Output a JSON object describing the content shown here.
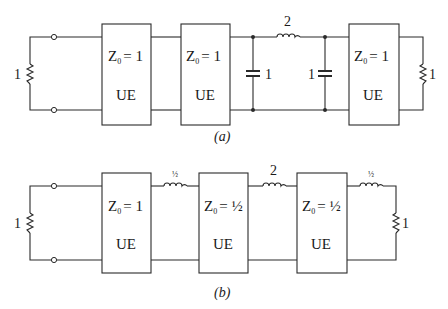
{
  "figure": {
    "background": "#ffffff",
    "line_color": "#2a2a2a"
  },
  "diagram_a": {
    "caption": "(a)",
    "source_resistor": {
      "value": "1"
    },
    "unit_elements": [
      {
        "z_label": "Z",
        "z_sub": "0",
        "z_eq": "= 1",
        "type": "UE"
      },
      {
        "z_label": "Z",
        "z_sub": "0",
        "z_eq": "= 1",
        "type": "UE"
      },
      {
        "z_label": "Z",
        "z_sub": "0",
        "z_eq": "= 1",
        "type": "UE"
      }
    ],
    "shunt_capacitor_1": {
      "value": "1"
    },
    "series_inductor": {
      "value": "2"
    },
    "shunt_capacitor_2": {
      "value": "1"
    },
    "load_resistor": {
      "value": "1"
    }
  },
  "diagram_b": {
    "caption": "(b)",
    "source_resistor": {
      "value": "1"
    },
    "unit_elements": [
      {
        "z_label": "Z",
        "z_sub": "0",
        "z_eq": "= 1",
        "type": "UE"
      },
      {
        "z_label": "Z",
        "z_sub": "0",
        "z_eq": "= ½",
        "type": "UE"
      },
      {
        "z_label": "Z",
        "z_sub": "0",
        "z_eq": "= ½",
        "type": "UE"
      }
    ],
    "series_inductor_1": {
      "value": "½"
    },
    "series_inductor_2": {
      "value": "2"
    },
    "series_inductor_3": {
      "value": "½"
    },
    "load_resistor": {
      "value": "1"
    }
  }
}
